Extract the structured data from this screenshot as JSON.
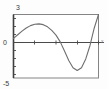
{
  "figure": {
    "background": "#fdfdfd",
    "curve_color": "#6e6e6e",
    "axis_color": "#4a4a4a",
    "frame_color": "#777777"
  },
  "labels": {
    "y_max": "3",
    "y_min": "-5",
    "y_zero": "0",
    "x_axis_name": "x"
  },
  "chart_data": {
    "type": "line",
    "title": "",
    "xlabel": "x",
    "ylabel": "",
    "grid": false,
    "legend": null,
    "xlim": [
      0,
      1
    ],
    "ylim": [
      -5,
      3
    ],
    "yticks": [
      3,
      0,
      -5
    ],
    "ytick_labels": [
      "3",
      "0",
      "-5"
    ],
    "xticks": [
      0,
      0.25,
      0.5,
      0.75,
      1
    ],
    "xtick_labels": [
      "",
      "",
      "",
      "",
      ""
    ],
    "series": [
      {
        "name": "curve",
        "x": [
          0.0,
          0.05,
          0.1,
          0.15,
          0.2,
          0.25,
          0.3,
          0.35,
          0.4,
          0.45,
          0.5,
          0.55,
          0.6,
          0.65,
          0.7,
          0.75,
          0.8,
          0.85,
          0.9,
          0.95,
          1.0
        ],
        "y": [
          0.0,
          0.45,
          0.9,
          1.3,
          1.6,
          1.78,
          1.82,
          1.72,
          1.45,
          1.0,
          0.4,
          -0.45,
          -1.6,
          -2.8,
          -3.7,
          -4.05,
          -3.7,
          -2.6,
          -0.9,
          1.3,
          3.2
        ]
      }
    ]
  }
}
